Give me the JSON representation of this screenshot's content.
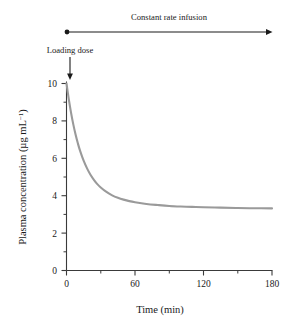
{
  "chart_data": {
    "type": "line",
    "title": "",
    "xlabel": "Time  (min)",
    "ylabel": "Plasma concentration  (µg mL−1)",
    "ylabel_main": "Plasma concentration  (µg mL",
    "ylabel_sup": "−1",
    "ylabel_close": ")",
    "xlim": [
      0,
      180
    ],
    "ylim": [
      0,
      10
    ],
    "xticks": [
      0,
      60,
      120,
      180
    ],
    "xtick_labels": [
      "0",
      "60",
      "120",
      "180"
    ],
    "xticks_minor": [
      30,
      90,
      150
    ],
    "yticks": [
      0,
      2,
      4,
      6,
      8,
      10
    ],
    "ytick_labels": [
      "0",
      "2",
      "4",
      "6",
      "8",
      "10"
    ],
    "yticks_minor": [
      1,
      3,
      5,
      7,
      9
    ],
    "grid": false,
    "legend": "none",
    "series": [
      {
        "name": "Plasma concentration",
        "color": "#9a9a9a",
        "loading_dose_peak": 10.0,
        "steady_state_plateau": 3.3,
        "decay_half_life_min": 10.5,
        "x": [
          0,
          2,
          4,
          6,
          8,
          10,
          12,
          15,
          18,
          21,
          24,
          27,
          30,
          35,
          40,
          45,
          50,
          55,
          60,
          70,
          80,
          90,
          100,
          110,
          120,
          135,
          150,
          165,
          180
        ],
        "y": [
          10.0,
          9.16,
          8.43,
          7.8,
          7.26,
          6.79,
          6.38,
          5.87,
          5.46,
          5.12,
          4.85,
          4.62,
          4.44,
          4.2,
          4.02,
          3.89,
          3.79,
          3.71,
          3.65,
          3.56,
          3.5,
          3.45,
          3.42,
          3.4,
          3.38,
          3.36,
          3.34,
          3.33,
          3.32
        ]
      }
    ],
    "annotations": [
      {
        "name": "constant-rate-infusion",
        "label": "Constant rate infusion",
        "type": "span-arrow",
        "x_start": 0,
        "x_end": 180
      },
      {
        "name": "loading-dose",
        "label": "Loading dose",
        "type": "down-arrow",
        "x": 0,
        "y": 10.0
      }
    ]
  }
}
